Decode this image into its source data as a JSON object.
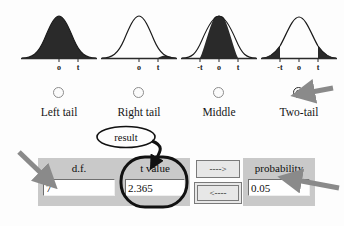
{
  "app": {
    "title": "t distribution tail selector",
    "background_color": "#fdfdfd",
    "panel_color": "#c9c9c9",
    "annotation_arrow_color": "#8a8a8a",
    "annotation_circle_color": "#111111"
  },
  "tail_options": [
    {
      "id": "left-tail",
      "label": "Left tail",
      "selected": false,
      "curve": {
        "fill": "left",
        "axis_ticks": [
          "o",
          "t"
        ]
      }
    },
    {
      "id": "right-tail",
      "label": "Right tail",
      "selected": false,
      "curve": {
        "fill": "right",
        "axis_ticks": [
          "o",
          "t"
        ]
      }
    },
    {
      "id": "middle",
      "label": "Middle",
      "selected": false,
      "curve": {
        "fill": "middle",
        "axis_ticks": [
          "-t",
          "o",
          "t"
        ]
      }
    },
    {
      "id": "two-tail",
      "label": "Two-tail",
      "selected": true,
      "curve": {
        "fill": "two-tail",
        "axis_ticks": [
          "-t",
          "o",
          "t"
        ]
      }
    }
  ],
  "fields": {
    "df": {
      "label": "d.f.",
      "value": "7"
    },
    "t_value": {
      "label": "t value",
      "value": "2.365"
    },
    "probability": {
      "label": "probability",
      "value": "0.05"
    }
  },
  "buttons": {
    "compute_forward": "---->",
    "compute_backward": "<----"
  },
  "annotations": {
    "result_callout": "result",
    "arrow_to_radio": "arrow-pointing-to-two-tail-radio",
    "arrow_to_df": "arrow-pointing-to-df-field",
    "arrow_to_probability": "arrow-pointing-to-probability-field",
    "circle_around_t_value": "circle-highlighting-t-value-panel",
    "result_arrow": "curved-arrow-from-result-to-t-value"
  }
}
